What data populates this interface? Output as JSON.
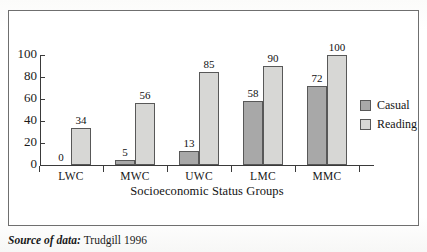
{
  "figure": {
    "source_label": "Source of data:",
    "source_value": "Trudgill 1996"
  },
  "chart_data": {
    "type": "bar",
    "title": "",
    "xlabel": "Socioeconomic Status Groups",
    "ylabel": "",
    "categories": [
      "LWC",
      "MWC",
      "UWC",
      "LMC",
      "MMC"
    ],
    "series": [
      {
        "name": "Casual",
        "color": "#a8a8a8",
        "values": [
          0,
          5,
          13,
          58,
          72
        ]
      },
      {
        "name": "Reading",
        "color": "#d7d7d5",
        "values": [
          34,
          56,
          85,
          90,
          100
        ]
      }
    ],
    "ylim": [
      0,
      100
    ],
    "yticks": [
      0,
      20,
      40,
      60,
      80,
      100
    ],
    "ytick_labels": [
      "0",
      "20",
      "40",
      "60",
      "80",
      "100"
    ],
    "grid": false,
    "legend_position": "right-outside",
    "data_labels": true
  }
}
